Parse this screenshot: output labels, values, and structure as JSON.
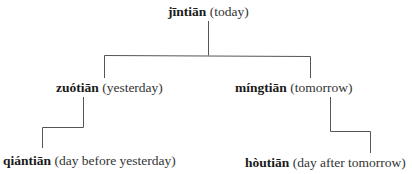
{
  "diagram": {
    "type": "tree",
    "root": {
      "term": "jīntiān",
      "gloss": "(today)"
    },
    "children": [
      {
        "term": "zuótiān",
        "gloss": "(yesterday)",
        "child": {
          "term": "qiántiān",
          "gloss": "(day before yesterday)"
        }
      },
      {
        "term": "míngtiān",
        "gloss": "(tomorrow)",
        "child": {
          "term": "hòutiān",
          "gloss": "(day after tomorrow)"
        }
      }
    ],
    "line_color": "#555555"
  }
}
